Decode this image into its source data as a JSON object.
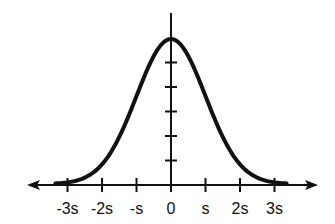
{
  "diagram": {
    "title": "",
    "type": "normal-distribution-curve",
    "x_axis": {
      "tick_labels": [
        "-3s",
        "-2s",
        "-s",
        "0",
        "s",
        "2s",
        "3s"
      ],
      "tick_values": [
        -3,
        -2,
        -1,
        0,
        1,
        2,
        3
      ],
      "arrows": "both-ends"
    },
    "y_axis": {
      "tick_count": 5,
      "labels": []
    },
    "curve": {
      "distribution": "normal",
      "mean": 0,
      "std_dev_label": "s",
      "color": "#000000"
    },
    "colors": {
      "ink": "#111111",
      "background": "#ffffff"
    }
  }
}
